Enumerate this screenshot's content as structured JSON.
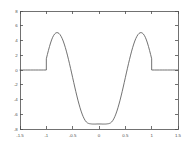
{
  "chart_data": {
    "type": "line",
    "title": "",
    "subtitle": "",
    "xlabel": "",
    "ylabel": "",
    "xlim": [
      -1.5,
      1.5
    ],
    "ylim": [
      -8,
      8
    ],
    "xticks": [
      -1.5,
      -1,
      -0.5,
      0,
      0.5,
      1,
      1.5
    ],
    "xticklabels": [
      "-1.5",
      "-1",
      "-0.5",
      "0",
      "0.5",
      "1",
      "1.5"
    ],
    "yticks": [
      -8,
      -6,
      -4,
      -2,
      0,
      2,
      4,
      6,
      8
    ],
    "yticklabels": [
      "-8",
      "-6",
      "-4",
      "-2",
      "0",
      "2",
      "4",
      "6",
      "8"
    ],
    "grid": false,
    "legend": null,
    "legend_position": "none",
    "box": true,
    "line_color": "#595959",
    "axis_color": "#4d4d4d",
    "background_color": "#ffffff",
    "annotations": [],
    "series": [
      {
        "name": "f(x)",
        "color": "#595959",
        "x": [
          -1.5,
          -1.45,
          -1.4,
          -1.35,
          -1.3,
          -1.25,
          -1.2,
          -1.15,
          -1.1,
          -1.05,
          -1.0,
          -1.0,
          -0.98,
          -0.96,
          -0.94,
          -0.92,
          -0.9,
          -0.88,
          -0.86,
          -0.84,
          -0.82,
          -0.8,
          -0.78,
          -0.76,
          -0.74,
          -0.72,
          -0.7,
          -0.68,
          -0.66,
          -0.64,
          -0.62,
          -0.6,
          -0.58,
          -0.56,
          -0.54,
          -0.52,
          -0.5,
          -0.48,
          -0.46,
          -0.44,
          -0.42,
          -0.4,
          -0.38,
          -0.36,
          -0.34,
          -0.32,
          -0.3,
          -0.28,
          -0.26,
          -0.24,
          -0.22,
          -0.2,
          -0.18,
          -0.16,
          -0.14,
          -0.12,
          -0.1,
          -0.08,
          -0.06,
          -0.04,
          -0.02,
          0.0,
          0.02,
          0.04,
          0.06,
          0.08,
          0.1,
          0.12,
          0.14,
          0.16,
          0.18,
          0.2,
          0.22,
          0.24,
          0.26,
          0.28,
          0.3,
          0.32,
          0.34,
          0.36,
          0.38,
          0.4,
          0.42,
          0.44,
          0.46,
          0.48,
          0.5,
          0.52,
          0.54,
          0.56,
          0.58,
          0.6,
          0.62,
          0.64,
          0.66,
          0.68,
          0.7,
          0.72,
          0.74,
          0.76,
          0.78,
          0.8,
          0.82,
          0.84,
          0.86,
          0.88,
          0.9,
          0.92,
          0.94,
          0.96,
          0.98,
          1.0,
          1.0,
          1.05,
          1.1,
          1.15,
          1.2,
          1.25,
          1.3,
          1.35,
          1.4,
          1.45,
          1.5
        ],
        "y": [
          0,
          0,
          0,
          0,
          0,
          0,
          0,
          0,
          0,
          0,
          0,
          1.52,
          2.1,
          2.66,
          3.18,
          3.66,
          4.08,
          4.43,
          4.7,
          4.9,
          5.02,
          5.07,
          5.05,
          4.96,
          4.8,
          4.57,
          4.28,
          3.93,
          3.52,
          3.07,
          2.56,
          2.02,
          1.45,
          0.85,
          0.23,
          -0.4,
          -1.04,
          -1.68,
          -2.31,
          -2.93,
          -3.52,
          -4.09,
          -4.62,
          -5.12,
          -5.57,
          -5.98,
          -6.33,
          -6.63,
          -6.87,
          -7.05,
          -7.17,
          -7.24,
          -7.28,
          -7.3,
          -7.32,
          -7.33,
          -7.33,
          -7.33,
          -7.33,
          -7.32,
          -7.32,
          -7.32,
          -7.32,
          -7.32,
          -7.33,
          -7.33,
          -7.33,
          -7.33,
          -7.32,
          -7.3,
          -7.28,
          -7.24,
          -7.17,
          -7.05,
          -6.87,
          -6.63,
          -6.33,
          -5.98,
          -5.57,
          -5.12,
          -4.62,
          -4.09,
          -3.52,
          -2.93,
          -2.31,
          -1.68,
          -1.04,
          -0.4,
          0.23,
          0.85,
          1.45,
          2.02,
          2.56,
          3.07,
          3.52,
          3.93,
          4.28,
          4.57,
          4.8,
          4.96,
          5.05,
          5.07,
          5.02,
          4.9,
          4.7,
          4.43,
          4.08,
          3.66,
          3.18,
          2.66,
          2.1,
          1.52,
          0,
          0,
          0,
          0,
          0,
          0,
          0,
          0,
          0,
          0,
          0
        ]
      }
    ]
  },
  "figure": {
    "plot_area": {
      "left": 20,
      "top": 11,
      "right": 178,
      "bottom": 129
    }
  }
}
